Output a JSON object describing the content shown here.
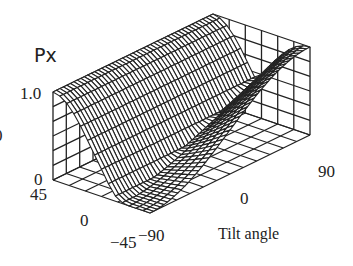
{
  "chart_data": {
    "type": "surface3d",
    "title": "",
    "zlabel": "Px",
    "xlabel": "",
    "ylabel": "Tilt angle",
    "x_axis": {
      "name": "angle",
      "range": [
        45,
        -45
      ],
      "ticks": [
        "45",
        "0",
        "-45"
      ]
    },
    "y_axis": {
      "name": "Tilt angle",
      "range": [
        -90,
        90
      ],
      "ticks": [
        "-90",
        "0",
        "90"
      ]
    },
    "z_axis": {
      "name": "Px",
      "range": [
        0,
        1.0
      ],
      "ticks": [
        "0",
        "1.0"
      ]
    },
    "z_tick_partial": "0",
    "grid": true,
    "line_color": "#222222",
    "background": "#ffffff"
  },
  "labels": {
    "z_title": "Px",
    "z_top": "1.0",
    "z_bottom": "0",
    "z_clipped": "0",
    "a_45": "45",
    "a_0": "0",
    "a_m45": "−45",
    "t_m90": "−90",
    "t_0": "0",
    "t_90": "90",
    "t_title": "Tilt angle"
  }
}
